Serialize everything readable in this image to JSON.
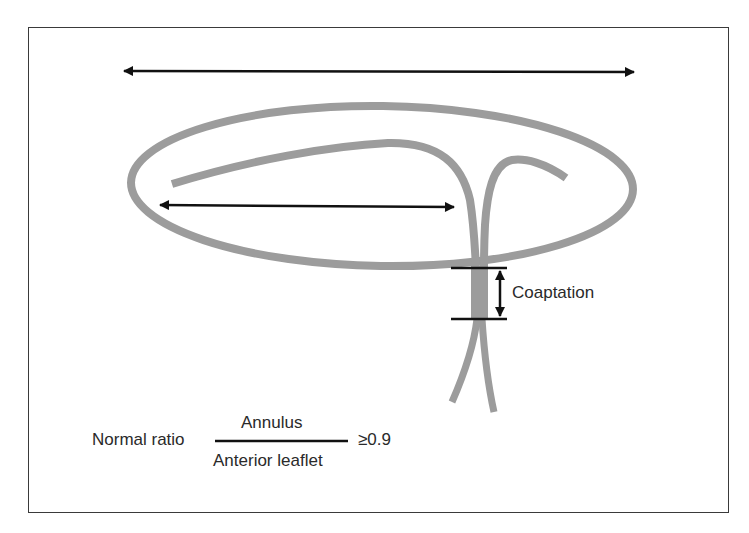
{
  "diagram": {
    "colors": {
      "structure_gray": "#9c9c9c",
      "arrow_black": "#111111",
      "frame": "#3a3a3a",
      "text": "#2a2a2a"
    },
    "labels": {
      "coaptation": "Coaptation",
      "ratio_prefix": "Normal ratio",
      "numerator": "Annulus",
      "denominator": "Anterior leaflet",
      "threshold": "≥0.9"
    },
    "elements": [
      {
        "id": "annulus-diameter-arrow",
        "type": "double-arrow",
        "meaning": "Annulus"
      },
      {
        "id": "annulus-ellipse",
        "type": "ellipse",
        "meaning": "Mitral annulus"
      },
      {
        "id": "anterior-leaflet",
        "type": "curve",
        "meaning": "Anterior leaflet"
      },
      {
        "id": "anterior-leaflet-length-arrow",
        "type": "double-arrow",
        "meaning": "Anterior leaflet"
      },
      {
        "id": "posterior-leaflet",
        "type": "curve",
        "meaning": "Posterior leaflet"
      },
      {
        "id": "coaptation-zone",
        "type": "band",
        "meaning": "Coaptation"
      },
      {
        "id": "coaptation-arrow",
        "type": "double-arrow",
        "meaning": "Coaptation length"
      }
    ]
  }
}
